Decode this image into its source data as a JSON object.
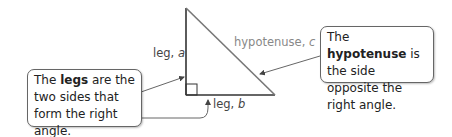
{
  "diagram": {
    "triangle": {
      "leg_a_label": "leg, ",
      "leg_a_var": "a",
      "leg_b_label": "leg, ",
      "leg_b_var": "b",
      "hypotenuse_label": "hypotenuse, ",
      "hypotenuse_var": "c"
    },
    "legs_callout": {
      "prefix": "The ",
      "term": "legs",
      "suffix": " are the two sides that form the right angle."
    },
    "hypotenuse_callout": {
      "prefix": "The ",
      "term": "hypotenuse",
      "suffix": " is the side opposite the right angle."
    },
    "colors": {
      "legs": "#333333",
      "hypotenuse": "#777777",
      "arrow": "#666666"
    }
  }
}
